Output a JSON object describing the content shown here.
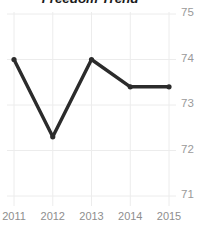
{
  "chart_data": {
    "type": "line",
    "title": "Freedom Trend",
    "xlabel": "",
    "ylabel": "",
    "categories": [
      "2011",
      "2012",
      "2013",
      "2014",
      "2015"
    ],
    "x": [
      2011,
      2012,
      2013,
      2014,
      2015
    ],
    "values": [
      74.0,
      72.3,
      74.0,
      73.4,
      73.4
    ],
    "series": [
      {
        "name": "Freedom Score",
        "values": [
          74.0,
          72.3,
          74.0,
          73.4,
          73.4
        ]
      }
    ],
    "ylim": [
      71,
      75
    ],
    "yticks": [
      71,
      72,
      73,
      74,
      75
    ],
    "ytick_labels": [
      "71",
      "72",
      "73",
      "74",
      "75"
    ],
    "xticks": [
      2011,
      2012,
      2013,
      2014,
      2015
    ],
    "xtick_labels": [
      "2011",
      "2012",
      "2013",
      "2014",
      "2015"
    ],
    "grid": true,
    "y_axis_position": "right",
    "legend": false,
    "legend_position": "none",
    "markers": true,
    "line_color": "#2b2b2b",
    "marker_color": "#2b2b2b",
    "grid_color": "#ececec",
    "tick_label_color": "#949494",
    "title_color": "#1b1b1b",
    "background_color": "#ffffff"
  }
}
